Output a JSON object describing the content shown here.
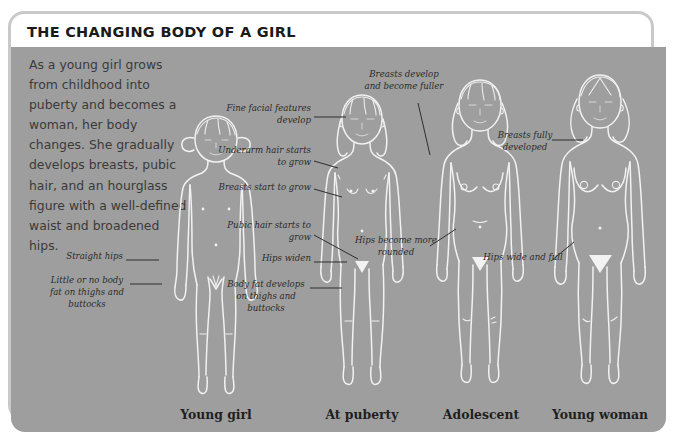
{
  "card": {
    "title": "THE CHANGING BODY OF A GIRL",
    "intro": "As a young girl grows from childhood into puberty and becomes a woman, her body changes. She gradually develops breasts, pubic hair, and an hourglass figure with a well-defined waist and broadened hips.",
    "panel_color": "#9e9e9e",
    "line_color": "#f2f2f2"
  },
  "figures": [
    {
      "caption": "Young girl",
      "labels": [
        {
          "text": "Straight hips"
        },
        {
          "text": "Little or no body fat on thighs and buttocks"
        }
      ]
    },
    {
      "caption": "At puberty",
      "labels": [
        {
          "text": "Fine facial features develop"
        },
        {
          "text": "Underarm hair starts to grow"
        },
        {
          "text": "Breasts start to grow"
        },
        {
          "text": "Pubic hair starts to grow"
        },
        {
          "text": "Hips widen"
        },
        {
          "text": "Body fat develops on thighs and buttocks"
        }
      ]
    },
    {
      "caption": "Adolescent",
      "labels": [
        {
          "text": "Breasts develop and become fuller"
        },
        {
          "text": "Hips become more rounded"
        }
      ]
    },
    {
      "caption": "Young woman",
      "labels": [
        {
          "text": "Breasts fully developed"
        },
        {
          "text": "Hips wide and full"
        }
      ]
    }
  ]
}
